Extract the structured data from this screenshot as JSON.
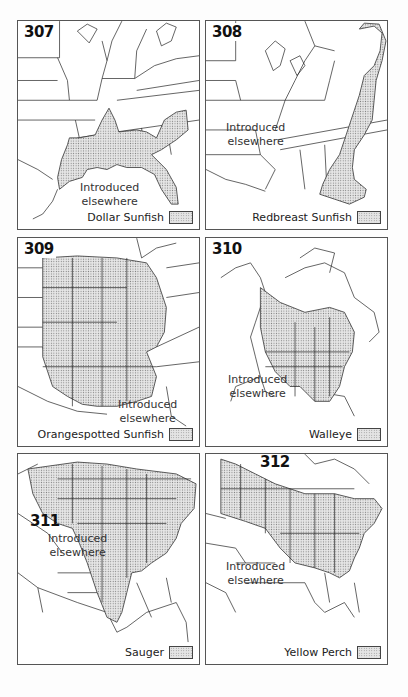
{
  "maps": [
    {
      "number": "307",
      "species": "Dollar Sunfish",
      "note": "Introduced elsewhere",
      "note_line1": "Introduced",
      "note_line2": "elsewhere",
      "region": "Southeastern United States"
    },
    {
      "number": "308",
      "species": "Redbreast Sunfish",
      "note": "Introduced elsewhere",
      "note_line1": "Introduced",
      "note_line2": "elsewhere",
      "region": "Atlantic slope, eastern United States"
    },
    {
      "number": "309",
      "species": "Orangespotted Sunfish",
      "note": "Introduced elsewhere",
      "note_line1": "Introduced",
      "note_line2": "elsewhere",
      "region": "Central United States"
    },
    {
      "number": "310",
      "species": "Walleye",
      "note": "Introduced elsewhere",
      "note_line1": "Introduced",
      "note_line2": "elsewhere",
      "region": "North America"
    },
    {
      "number": "311",
      "species": "Sauger",
      "note": "Introduced elsewhere",
      "note_line1": "Introduced",
      "note_line2": "elsewhere",
      "region": "Central North America"
    },
    {
      "number": "312",
      "species": "Yellow Perch",
      "note": "Introduced elsewhere",
      "note_line1": "Introduced",
      "note_line2": "elsewhere",
      "region": "Northeastern North America"
    }
  ],
  "legend_style": {
    "swatch_fill": "#e4e4e4",
    "dot_color": "#888888",
    "border": "#555555"
  }
}
